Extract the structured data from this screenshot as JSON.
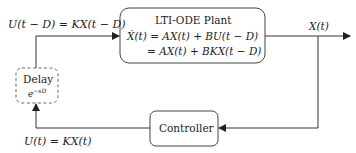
{
  "diagram": {
    "type": "block-diagram",
    "colors": {
      "stroke": "#333333",
      "dashed_stroke": "#666666",
      "text": "#222222"
    },
    "plant": {
      "title": "LTI-ODE Plant",
      "eq_line1": "Ẋ(t) = AX(t) + BU(t − D)",
      "eq_line2": "= AX(t) + BKX(t − D)"
    },
    "delay": {
      "title": "Delay",
      "transfer": "e",
      "transfer_exp": "−sD"
    },
    "controller": {
      "title": "Controller"
    },
    "signals": {
      "delayed_input": "U(t − D) = KX(t − D)",
      "output": "X(t)",
      "control": "U(t) = KX(t)"
    }
  }
}
